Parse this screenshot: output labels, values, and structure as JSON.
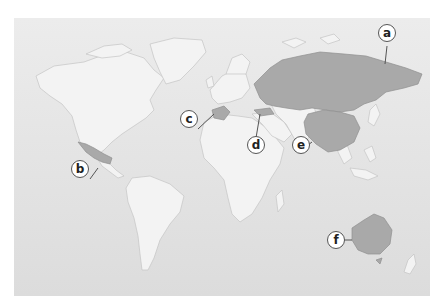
{
  "map": {
    "type": "world-map",
    "colors": {
      "ocean": "#e4e4e4",
      "land": "#f2f2f2",
      "highlight": "#a9a9a9",
      "border": "#bdbdbd"
    },
    "labels": [
      {
        "id": "a",
        "label": "a",
        "region": "Russia"
      },
      {
        "id": "b",
        "label": "b",
        "region": "Mexico"
      },
      {
        "id": "c",
        "label": "c",
        "region": "Spain"
      },
      {
        "id": "d",
        "label": "d",
        "region": "Turkey"
      },
      {
        "id": "e",
        "label": "e",
        "region": "China"
      },
      {
        "id": "f",
        "label": "f",
        "region": "Australia"
      }
    ]
  }
}
